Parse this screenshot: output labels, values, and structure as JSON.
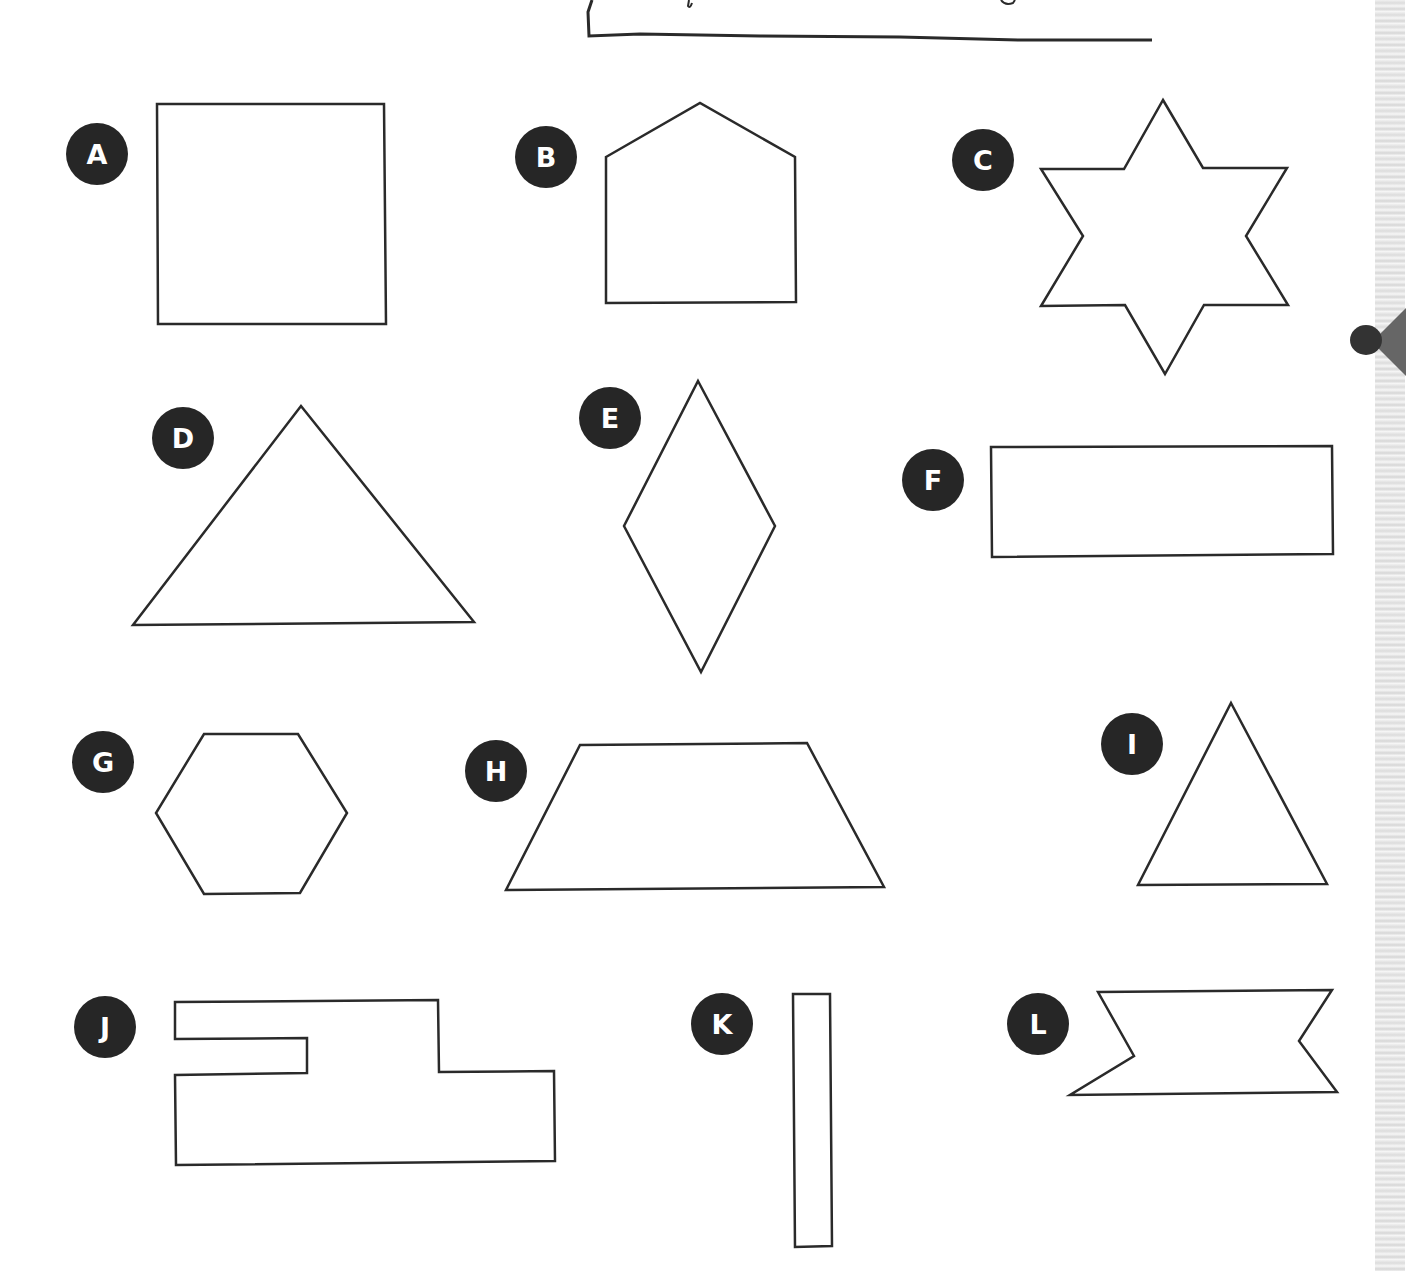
{
  "worksheet": {
    "header_frame": "hand-drawn title box (text cut off at top edge)",
    "shapes": [
      {
        "label": "A",
        "name": "square",
        "badge": {
          "x": 66,
          "y": 123
        },
        "points": "157,104 384,104 386,324 158,324"
      },
      {
        "label": "B",
        "name": "pentagon-house",
        "badge": {
          "x": 515,
          "y": 126
        },
        "points": "606,157 700,103 795,157 796,302 606,303"
      },
      {
        "label": "C",
        "name": "six-point-star",
        "badge": {
          "x": 952,
          "y": 129
        },
        "points": "1163,100 1203,168 1287,168 1246,236 1288,305 1204,305 1165,374 1125,305 1041,306 1083,236 1041,169 1124,169"
      },
      {
        "label": "D",
        "name": "large-triangle",
        "badge": {
          "x": 152,
          "y": 407
        },
        "points": "301,406 474,622 133,625"
      },
      {
        "label": "E",
        "name": "rhombus",
        "badge": {
          "x": 579,
          "y": 387
        },
        "points": "698,381 775,526 701,672 624,526"
      },
      {
        "label": "F",
        "name": "long-rectangle",
        "badge": {
          "x": 902,
          "y": 449
        },
        "points": "991,447 1332,446 1333,554 992,557"
      },
      {
        "label": "G",
        "name": "hexagon",
        "badge": {
          "x": 72,
          "y": 731
        },
        "points": "204,734 298,734 347,813 300,893 204,894 156,813"
      },
      {
        "label": "H",
        "name": "trapezoid",
        "badge": {
          "x": 465,
          "y": 740
        },
        "points": "580,745 807,743 884,887 506,890"
      },
      {
        "label": "I",
        "name": "small-triangle",
        "badge": {
          "x": 1101,
          "y": 713
        },
        "points": "1231,703 1327,884 1138,885"
      },
      {
        "label": "J",
        "name": "notched-irregular-polygon",
        "badge": {
          "x": 74,
          "y": 996
        },
        "points": "175,1002 438,1000 439,1072 554,1071 555,1161 176,1165 175,1075 307,1073 307,1038 175,1039"
      },
      {
        "label": "K",
        "name": "thin-vertical-rectangle",
        "badge": {
          "x": 691,
          "y": 993
        },
        "points": "793,994 830,994 832,1246 795,1247"
      },
      {
        "label": "L",
        "name": "ribbon-banner",
        "badge": {
          "x": 1007,
          "y": 993
        },
        "points": "1098,992 1332,990 1299,1041 1337,1092 1070,1095 1134,1056"
      }
    ]
  },
  "colors": {
    "stroke": "#2a2a2a",
    "badge": "#262626",
    "badge_text": "#ffffff",
    "background": "#ffffff"
  }
}
